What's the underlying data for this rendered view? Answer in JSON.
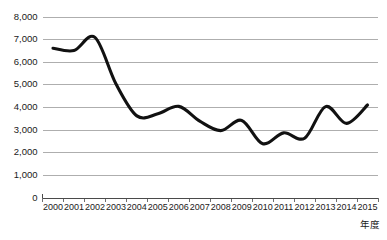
{
  "chart_data": {
    "type": "line",
    "title": "",
    "xlabel": "年度",
    "ylabel": "",
    "x": [
      2000,
      2001,
      2002,
      2003,
      2004,
      2005,
      2006,
      2007,
      2008,
      2009,
      2010,
      2011,
      2012,
      2013,
      2014,
      2015
    ],
    "categories": [
      "2000",
      "2001",
      "2002",
      "2003",
      "2004",
      "2005",
      "2006",
      "2007",
      "2008",
      "2009",
      "2010",
      "2011",
      "2012",
      "2013",
      "2014",
      "2015"
    ],
    "values": [
      6620,
      6520,
      7100,
      5050,
      3630,
      3720,
      4050,
      3400,
      2980,
      3430,
      2400,
      2880,
      2640,
      4040,
      3300,
      4110
    ],
    "series": [
      {
        "name": "",
        "color": "#111111",
        "values": [
          6620,
          6520,
          7100,
          5050,
          3630,
          3720,
          4050,
          3400,
          2980,
          3430,
          2400,
          2880,
          2640,
          4040,
          3300,
          4110
        ]
      }
    ],
    "ylim": [
      0,
      8000
    ],
    "ytick_values": [
      0,
      1000,
      2000,
      3000,
      4000,
      5000,
      6000,
      7000,
      8000
    ],
    "ytick_labels": [
      "0",
      "1,000",
      "2,000",
      "3,000",
      "4,000",
      "5,000",
      "6,000",
      "7,000",
      "8,000"
    ],
    "xtick_labels": [
      "2000",
      "2001",
      "2002",
      "2003",
      "2004",
      "2005",
      "2006",
      "2007",
      "2008",
      "2009",
      "2010",
      "2011",
      "2012",
      "2013",
      "2014",
      "2015"
    ],
    "grid": true,
    "grid_axis": "y",
    "legend": false,
    "legend_position": "none",
    "smoothing": "spline",
    "colors": {
      "line": "#111111",
      "gridline": "#9a9a9a",
      "axis": "#4a4a4a",
      "text": "#1a1a1a",
      "background": "#ffffff"
    }
  }
}
